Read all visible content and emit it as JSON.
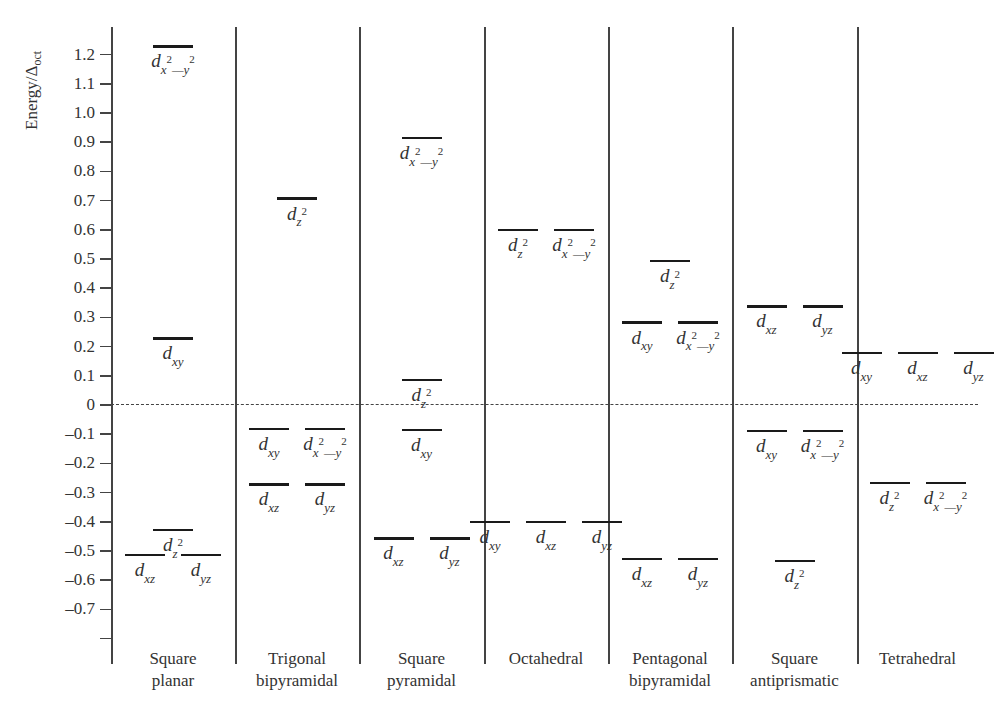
{
  "chart_data": {
    "type": "energy-level-diagram",
    "title": "",
    "ylabel": "Energy/Δoct",
    "ylabel_main": "Energy/Δ",
    "ylabel_sub": "oct",
    "ylim": [
      -0.8,
      1.2
    ],
    "yticks": [
      1.2,
      1.1,
      1.0,
      0.9,
      0.8,
      0.7,
      0.6,
      0.5,
      0.4,
      0.3,
      0.2,
      0.1,
      0,
      -0.1,
      -0.2,
      -0.3,
      -0.4,
      -0.5,
      -0.6,
      -0.7,
      -0.8
    ],
    "ytick_labels": [
      "1.2",
      "1.1",
      "1.0",
      "0.9",
      "0.8",
      "0.7",
      "0.6",
      "0.5",
      "0.4",
      "0.3",
      "0.2",
      "0.1",
      "0",
      "–0.1",
      "–0.2",
      "–0.3",
      "–0.4",
      "–0.5",
      "–0.6",
      "–0.7",
      ""
    ],
    "reference_line": {
      "y": 0,
      "style": "dashed"
    },
    "categories": [
      "Square planar",
      "Trigonal bipyramidal",
      "Square pyramidal",
      "Octahedral",
      "Pentagonal bipyramidal",
      "Square antiprismatic",
      "Tetrahedral"
    ],
    "panels": [
      {
        "label_lines": [
          "Square",
          "planar"
        ],
        "levels": [
          {
            "energy": 1.228,
            "orbitals": [
              {
                "d": "d",
                "sub": "x2—y2",
                "html": "x<sup>2</sup>—y<sup>2</sup>"
              }
            ]
          },
          {
            "energy": 0.228,
            "orbitals": [
              {
                "d": "d",
                "sub": "xy"
              }
            ]
          },
          {
            "energy": -0.428,
            "orbitals": [
              {
                "d": "d",
                "sub": "z2"
              }
            ]
          },
          {
            "energy": -0.514,
            "orbitals": [
              {
                "d": "d",
                "sub": "xz"
              },
              {
                "d": "d",
                "sub": "yz"
              }
            ]
          }
        ]
      },
      {
        "label_lines": [
          "Trigonal",
          "bipyramidal"
        ],
        "levels": [
          {
            "energy": 0.707,
            "orbitals": [
              {
                "d": "d",
                "sub": "z2"
              }
            ]
          },
          {
            "energy": -0.082,
            "orbitals": [
              {
                "d": "d",
                "sub": "xy"
              },
              {
                "d": "d",
                "sub": "x2—y2"
              }
            ]
          },
          {
            "energy": -0.272,
            "orbitals": [
              {
                "d": "d",
                "sub": "xz"
              },
              {
                "d": "d",
                "sub": "yz"
              }
            ]
          }
        ]
      },
      {
        "label_lines": [
          "Square",
          "pyramidal"
        ],
        "levels": [
          {
            "energy": 0.914,
            "orbitals": [
              {
                "d": "d",
                "sub": "x2—y2"
              }
            ]
          },
          {
            "energy": 0.086,
            "orbitals": [
              {
                "d": "d",
                "sub": "z2"
              }
            ]
          },
          {
            "energy": -0.086,
            "orbitals": [
              {
                "d": "d",
                "sub": "xy"
              }
            ]
          },
          {
            "energy": -0.457,
            "orbitals": [
              {
                "d": "d",
                "sub": "xz"
              },
              {
                "d": "d",
                "sub": "yz"
              }
            ]
          }
        ]
      },
      {
        "label_lines": [
          "Octahedral"
        ],
        "levels": [
          {
            "energy": 0.6,
            "orbitals": [
              {
                "d": "d",
                "sub": "z2"
              },
              {
                "d": "d",
                "sub": "x2—y2"
              }
            ]
          },
          {
            "energy": -0.4,
            "orbitals": [
              {
                "d": "d",
                "sub": "xy"
              },
              {
                "d": "d",
                "sub": "xz"
              },
              {
                "d": "d",
                "sub": "yz"
              }
            ]
          }
        ]
      },
      {
        "label_lines": [
          "Pentagonal",
          "bipyramidal"
        ],
        "levels": [
          {
            "energy": 0.493,
            "orbitals": [
              {
                "d": "d",
                "sub": "z2"
              }
            ]
          },
          {
            "energy": 0.282,
            "orbitals": [
              {
                "d": "d",
                "sub": "xy"
              },
              {
                "d": "d",
                "sub": "x2—y2"
              }
            ]
          },
          {
            "energy": -0.528,
            "orbitals": [
              {
                "d": "d",
                "sub": "xz"
              },
              {
                "d": "d",
                "sub": "yz"
              }
            ]
          }
        ]
      },
      {
        "label_lines": [
          "Square",
          "antiprismatic"
        ],
        "levels": [
          {
            "energy": 0.338,
            "orbitals": [
              {
                "d": "d",
                "sub": "xz"
              },
              {
                "d": "d",
                "sub": "yz"
              }
            ]
          },
          {
            "energy": -0.089,
            "orbitals": [
              {
                "d": "d",
                "sub": "xy"
              },
              {
                "d": "d",
                "sub": "x2—y2"
              }
            ]
          },
          {
            "energy": -0.534,
            "orbitals": [
              {
                "d": "d",
                "sub": "z2"
              }
            ]
          }
        ]
      },
      {
        "label_lines": [
          "Tetrahedral"
        ],
        "levels": [
          {
            "energy": 0.178,
            "orbitals": [
              {
                "d": "d",
                "sub": "xy"
              },
              {
                "d": "d",
                "sub": "xz"
              },
              {
                "d": "d",
                "sub": "yz"
              }
            ]
          },
          {
            "energy": -0.267,
            "orbitals": [
              {
                "d": "d",
                "sub": "z2"
              },
              {
                "d": "d",
                "sub": "x2—y2"
              }
            ]
          }
        ]
      }
    ],
    "grid": false,
    "legend": null
  },
  "layout": {
    "axis_x": 111,
    "y_zero": 405,
    "px_per_unit": 292,
    "top_y": 27,
    "bottom_y": 664,
    "panel_edges": [
      111,
      235,
      359,
      484,
      608,
      732,
      857,
      978
    ],
    "bar_width": 40,
    "bar_gap": 16,
    "colors": {
      "line": "#444444",
      "level": "#1a1a1a",
      "text": "#333333"
    }
  }
}
